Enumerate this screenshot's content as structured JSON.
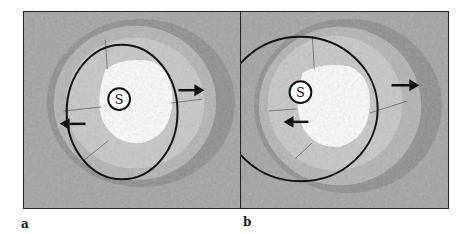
{
  "figure": {
    "panels": [
      {
        "id": "a",
        "label": "a",
        "center_marker": "S"
      },
      {
        "id": "b",
        "label": "b",
        "center_marker": "S"
      }
    ]
  }
}
